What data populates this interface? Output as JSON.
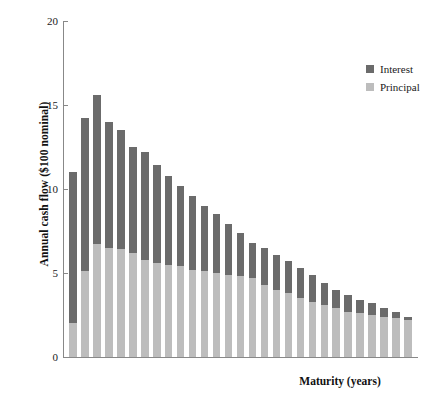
{
  "chart_data": {
    "type": "bar",
    "subtype": "stacked-bar",
    "title": "",
    "xlabel": "Maturity (years)",
    "ylabel": "Annual cash flow ($100 nominal)",
    "ylim": [
      0,
      20
    ],
    "yticks": [
      0,
      5,
      10,
      15,
      20
    ],
    "ytick_labels": [
      "0",
      "5",
      "10",
      "15",
      "20"
    ],
    "xticks": [],
    "xtick_labels": [],
    "grid": false,
    "legend_position": "top-right",
    "categories": [
      1,
      2,
      3,
      4,
      5,
      6,
      7,
      8,
      9,
      10,
      11,
      12,
      13,
      14,
      15,
      16,
      17,
      18,
      19,
      20,
      21,
      22,
      23,
      24,
      25,
      26,
      27,
      28,
      29
    ],
    "series": [
      {
        "name": "Principal",
        "color": "#bdbdbd",
        "values": [
          2.0,
          5.1,
          6.7,
          6.5,
          6.4,
          6.2,
          5.8,
          5.6,
          5.5,
          5.4,
          5.2,
          5.1,
          5.0,
          4.9,
          4.8,
          4.7,
          4.3,
          4.0,
          3.8,
          3.5,
          3.3,
          3.1,
          2.9,
          2.7,
          2.6,
          2.5,
          2.4,
          2.3,
          2.2
        ]
      },
      {
        "name": "Interest",
        "color": "#6b6b6b",
        "values": [
          9.0,
          9.1,
          8.9,
          7.5,
          7.1,
          6.3,
          6.4,
          5.8,
          5.3,
          4.8,
          4.4,
          3.9,
          3.5,
          3.0,
          2.6,
          2.1,
          2.2,
          2.1,
          1.9,
          1.8,
          1.6,
          1.3,
          1.1,
          1.0,
          0.8,
          0.7,
          0.5,
          0.4,
          0.2
        ]
      }
    ],
    "totals": [
      11.0,
      14.2,
      15.6,
      14.0,
      13.5,
      12.5,
      12.2,
      11.4,
      10.8,
      10.2,
      9.6,
      9.0,
      8.5,
      7.9,
      7.4,
      6.8,
      6.5,
      6.1,
      5.7,
      5.3,
      4.9,
      4.4,
      4.0,
      3.7,
      3.4,
      3.2,
      2.9,
      2.7,
      2.4
    ]
  },
  "legend": {
    "items": [
      {
        "label": "Interest",
        "color": "#6b6b6b"
      },
      {
        "label": "Principal",
        "color": "#bdbdbd"
      }
    ]
  },
  "axes": {
    "y_title": "Annual cash flow ($100 nominal)",
    "x_title": "Maturity (years)"
  }
}
